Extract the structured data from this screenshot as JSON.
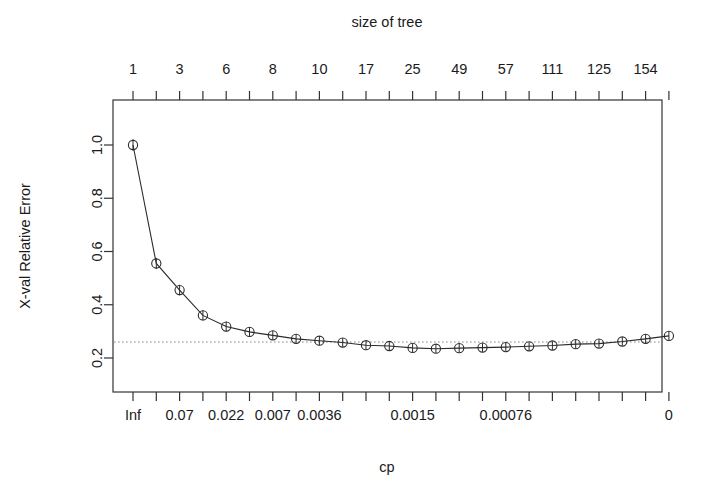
{
  "chart_data": {
    "type": "line",
    "title": "",
    "xlabel": "cp",
    "ylabel": "X-val Relative Error",
    "top_axis_label": "size of tree",
    "ylim": [
      0.18,
      1.06
    ],
    "grid": false,
    "legend": null,
    "y_ticks": [
      "0.2",
      "0.4",
      "0.6",
      "0.8",
      "1.0"
    ],
    "y_tick_values": [
      0.2,
      0.4,
      0.6,
      0.8,
      1.0
    ],
    "top_tick_count": 24,
    "top_tick_labels": [
      "1",
      "",
      "3",
      "",
      "6",
      "",
      "8",
      "",
      "10",
      "",
      "17",
      "",
      "25",
      "",
      "49",
      "",
      "57",
      "",
      "111",
      "",
      "125",
      "",
      "154",
      ""
    ],
    "size_of_tree": [
      1,
      2,
      3,
      4,
      6,
      7,
      8,
      9,
      10,
      12,
      17,
      21,
      25,
      29,
      49,
      53,
      57,
      69,
      111,
      117,
      125,
      140,
      154,
      168
    ],
    "bottom_tick_labels": [
      "Inf",
      "",
      "0.07",
      "",
      "0.022",
      "",
      "0.007",
      "",
      "0.0036",
      "",
      "0.0015",
      "",
      "0.00076",
      "",
      "0"
    ],
    "bottom_tick_label_positions": [
      0,
      2,
      4,
      6,
      8,
      11,
      14,
      17,
      20,
      23
    ],
    "bottom_tick_label_texts": [
      "Inf",
      "0.07",
      "0.022",
      "0.007",
      "0.0036",
      "0.0015",
      "0.00076",
      "0"
    ],
    "bottom_label_indices": [
      0,
      2,
      4,
      6,
      8,
      12,
      16,
      23
    ],
    "cp": [
      "Inf",
      "",
      "0.07",
      "",
      "0.022",
      "",
      "0.007",
      "",
      "0.0036",
      "",
      "",
      "",
      "0.0015",
      "",
      "",
      "",
      "0.00076",
      "",
      "",
      "",
      "",
      "",
      "",
      "0"
    ],
    "xerror": [
      1.0,
      0.555,
      0.455,
      0.36,
      0.318,
      0.298,
      0.285,
      0.272,
      0.265,
      0.258,
      0.248,
      0.245,
      0.238,
      0.235,
      0.237,
      0.239,
      0.241,
      0.244,
      0.247,
      0.252,
      0.254,
      0.262,
      0.272,
      0.283
    ],
    "xstd": [
      0.022,
      0.021,
      0.02,
      0.019,
      0.018,
      0.018,
      0.017,
      0.017,
      0.017,
      0.016,
      0.016,
      0.016,
      0.016,
      0.016,
      0.016,
      0.016,
      0.016,
      0.016,
      0.016,
      0.016,
      0.016,
      0.016,
      0.017,
      0.017
    ],
    "reference_line": 0.26,
    "reference_line_style": "dotted",
    "point_symbol": "circle-with-errorbar"
  },
  "colors": {
    "line": "#2b2b2b",
    "axis": "#333333",
    "reference": "#8a8a8a",
    "background": "#ffffff",
    "text": "#1a1a1a"
  }
}
